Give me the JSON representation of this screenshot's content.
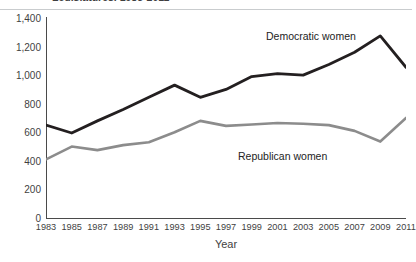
{
  "chart": {
    "title": "Legislatures, 1983-2011",
    "x_axis_label": "Year",
    "series_labels": {
      "democratic": "Democratic women",
      "republican": "Republican women"
    },
    "colors": {
      "democratic": "#231f20",
      "republican": "#8c8c8c",
      "axis": "#4a4a4a",
      "text": "#3f3f3f",
      "rule": "#c9ccce",
      "background": "#ffffff"
    }
  },
  "chart_data": {
    "type": "line",
    "title": "Legislatures, 1983-2011",
    "xlabel": "Year",
    "ylabel": "",
    "xlim": [
      1983,
      2011
    ],
    "ylim": [
      0,
      1400
    ],
    "grid": false,
    "legend_position": "inline-annotation",
    "x": [
      1983,
      1985,
      1987,
      1989,
      1991,
      1993,
      1995,
      1997,
      1999,
      2001,
      2003,
      2005,
      2007,
      2009,
      2011
    ],
    "xtick_labels": [
      "1983",
      "1985",
      "1987",
      "1989",
      "1991",
      "1993",
      "1995",
      "1997",
      "1999",
      "2001",
      "2003",
      "2005",
      "2007",
      "2009",
      "2011"
    ],
    "ytick_labels": [
      "0",
      "200",
      "400",
      "600",
      "800",
      "1,000",
      "1,200",
      "1,400"
    ],
    "yticks": [
      0,
      200,
      400,
      600,
      800,
      1000,
      1200,
      1400
    ],
    "series": [
      {
        "name": "Democratic women",
        "color": "#231f20",
        "values": [
          650,
          595,
          680,
          760,
          845,
          930,
          845,
          900,
          990,
          1010,
          1000,
          1075,
          1160,
          1275,
          1055
        ]
      },
      {
        "name": "Republican women",
        "color": "#8c8c8c",
        "values": [
          410,
          500,
          475,
          510,
          530,
          600,
          680,
          645,
          655,
          665,
          660,
          650,
          610,
          535,
          700
        ]
      }
    ]
  }
}
